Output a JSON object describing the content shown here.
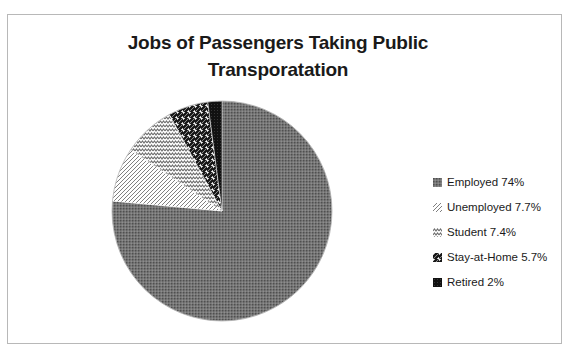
{
  "chart_data": {
    "type": "pie",
    "title": "Jobs of Passengers Taking Public Transporatation",
    "title_line1": "Jobs of Passengers Taking Public",
    "title_line2": "Transporatation",
    "categories": [
      "Employed",
      "Unemployed",
      "Student",
      "Stay-at-Home",
      "Retired"
    ],
    "values": [
      74,
      7.7,
      7.4,
      5.7,
      2
    ],
    "value_labels": [
      "74%",
      "7.7%",
      "7.4%",
      "5.7%",
      "2%"
    ],
    "legend_position": "right",
    "grid": false,
    "xlabel": "",
    "ylabel": "",
    "slices": [
      {
        "label": "Employed 74%",
        "name": "Employed",
        "value": 74,
        "value_label": "74%",
        "pattern": "dotted-dark-gray",
        "color": "#6b6b6b"
      },
      {
        "label": "Unemployed 7.7%",
        "name": "Unemployed",
        "value": 7.7,
        "value_label": "7.7%",
        "pattern": "fine-hatch-light",
        "color": "#d8d8d8"
      },
      {
        "label": "Student 7.4%",
        "name": "Student",
        "value": 7.4,
        "value_label": "7.4%",
        "pattern": "zigzag-wave",
        "color": "#cfcfcf"
      },
      {
        "label": "Stay-at-Home 5.7%",
        "name": "Stay-at-Home",
        "value": 5.7,
        "value_label": "5.7%",
        "pattern": "diagonal-stripes",
        "color": "#2b2b2b"
      },
      {
        "label": "Retired 2%",
        "name": "Retired",
        "value": 2,
        "value_label": "2%",
        "pattern": "solid-black",
        "color": "#111111"
      }
    ]
  },
  "legend": {
    "items": [
      {
        "label": "Employed 74%"
      },
      {
        "label": "Unemployed 7.7%"
      },
      {
        "label": "Student 7.4%"
      },
      {
        "label": "Stay-at-Home 5.7%"
      },
      {
        "label": "Retired 2%"
      }
    ]
  },
  "colors": {
    "frame_border": "#b8b8b8",
    "text": "#1a1a1a",
    "background": "#ffffff"
  }
}
